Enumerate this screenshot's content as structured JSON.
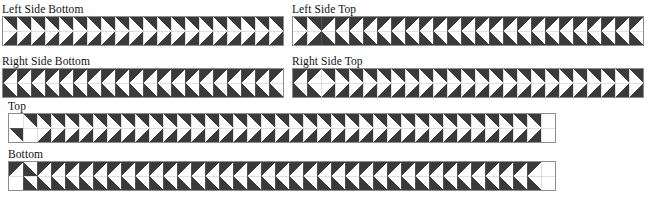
{
  "page": {
    "background": "#ffffff",
    "width": 654,
    "height": 197
  },
  "style": {
    "dark": "#3a3a3a",
    "light": "#ffffff",
    "grid_line": "#8c8c8c",
    "text": "#111111",
    "cell_size": 14
  },
  "panels": [
    {
      "id": "left-side-bottom",
      "label": "Left Side Bottom",
      "x": 2,
      "y": 3,
      "label_y": 3,
      "grid_x": 2,
      "grid_y": 18,
      "cols": 20,
      "rows": 2,
      "cell": 14,
      "motif": "pyramid-left",
      "note": "Dark triangles with apex pointing down-left; rows mirrored vertically forming diamond column seams."
    },
    {
      "id": "left-side-top",
      "label": "Left Side Top",
      "x": 292,
      "y": 3,
      "label_y": 3,
      "grid_x": 292,
      "grid_y": 18,
      "cols": 25,
      "rows": 2,
      "cell": 14,
      "motif": "pyramid-right",
      "note": "First two columns mirrored forming a V notch, remaining columns lean right."
    },
    {
      "id": "right-side-bottom",
      "label": "Right Side Bottom",
      "x": 2,
      "y": 55,
      "label_y": 55,
      "grid_x": 2,
      "grid_y": 70,
      "cols": 20,
      "rows": 2,
      "cell": 14,
      "motif": "pyramid-right",
      "note": "Mirror image of Left Side Bottom."
    },
    {
      "id": "right-side-top",
      "label": "Right Side Top",
      "x": 292,
      "y": 55,
      "label_y": 55,
      "grid_x": 292,
      "grid_y": 70,
      "cols": 25,
      "rows": 2,
      "cell": 14,
      "motif": "pyramid-left",
      "note": "Mirror image of Left Side Top."
    },
    {
      "id": "top",
      "label": "Top",
      "x": 8,
      "y": 100,
      "label_y": 100,
      "grid_x": 8,
      "grid_y": 113,
      "cols": 39,
      "rows": 2,
      "cell": 14,
      "motif": "pyramid-left",
      "note": "Blank white cell at leading top-left and trailing bottom-right; wide band."
    },
    {
      "id": "bottom",
      "label": "Bottom",
      "x": 8,
      "y": 148,
      "label_y": 148,
      "grid_x": 8,
      "grid_y": 161,
      "cols": 39,
      "rows": 2,
      "cell": 14,
      "motif": "pyramid-right",
      "note": "Blank white cell at leading bottom-left and trailing top-right; wide band."
    }
  ]
}
